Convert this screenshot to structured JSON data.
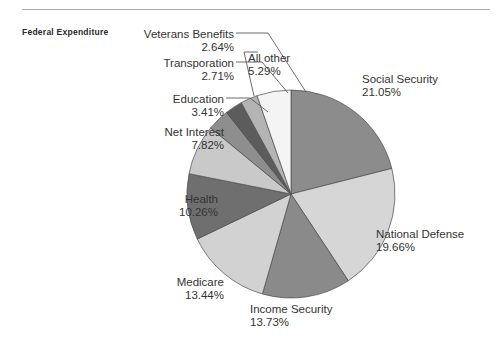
{
  "series_title": "Federal Expenditure",
  "chart_data": {
    "type": "pie",
    "title": "Federal Expenditure",
    "xlabel": "",
    "ylabel": "",
    "units": "percent",
    "legend_position": "none",
    "grid": false,
    "start_angle_deg": 0,
    "direction": "clockwise",
    "categories": [
      "Social Security",
      "National Defense",
      "Income Security",
      "Medicare",
      "Health",
      "Net Interest",
      "Education",
      "Transporation",
      "Veterans Benefits",
      "All other"
    ],
    "values": [
      21.05,
      19.66,
      13.73,
      13.44,
      10.26,
      7.82,
      3.41,
      2.71,
      2.64,
      5.29
    ],
    "value_labels": [
      "21.05%",
      "19.66%",
      "13.73%",
      "13.44%",
      "10.26%",
      "7.82%",
      "3.41%",
      "2.71%",
      "2.64%",
      "5.29%"
    ],
    "colors": [
      "#8c8c8c",
      "#d6d6d6",
      "#8a8a8a",
      "#d2d2d2",
      "#6f6f6f",
      "#c9c9c9",
      "#8e8e8e",
      "#5c5c5c",
      "#b4b4b4",
      "#f4f4f4"
    ],
    "slices": [
      {
        "label": "Social Security",
        "value": 21.05,
        "value_label": "21.05%",
        "color": "#8c8c8c"
      },
      {
        "label": "National Defense",
        "value": 19.66,
        "value_label": "19.66%",
        "color": "#d6d6d6"
      },
      {
        "label": "Income Security",
        "value": 13.73,
        "value_label": "13.73%",
        "color": "#8a8a8a"
      },
      {
        "label": "Medicare",
        "value": 13.44,
        "value_label": "13.44%",
        "color": "#d2d2d2"
      },
      {
        "label": "Health",
        "value": 10.26,
        "value_label": "10.26%",
        "color": "#6f6f6f"
      },
      {
        "label": "Net Interest",
        "value": 7.82,
        "value_label": "7.82%",
        "color": "#c9c9c9"
      },
      {
        "label": "Education",
        "value": 3.41,
        "value_label": "3.41%",
        "color": "#8e8e8e"
      },
      {
        "label": "Transporation",
        "value": 2.71,
        "value_label": "2.71%",
        "color": "#5c5c5c"
      },
      {
        "label": "Veterans Benefits",
        "value": 2.64,
        "value_label": "2.64%",
        "color": "#b4b4b4"
      },
      {
        "label": "All other",
        "value": 5.29,
        "value_label": "5.29%",
        "color": "#f4f4f4"
      }
    ]
  },
  "labels": {
    "veterans": {
      "name": "Veterans Benefits",
      "pct": "2.64%"
    },
    "transport": {
      "name": "Transporation",
      "pct": "2.71%"
    },
    "education": {
      "name": "Education",
      "pct": "3.41%"
    },
    "netint": {
      "name": "Net Interest",
      "pct": "7.82%"
    },
    "health": {
      "name": "Health",
      "pct": "10.26%"
    },
    "medicare": {
      "name": "Medicare",
      "pct": "13.44%"
    },
    "income": {
      "name": "Income Security",
      "pct": "13.73%"
    },
    "defense": {
      "name": "National Defense",
      "pct": "19.66%"
    },
    "social": {
      "name": "Social Security",
      "pct": "21.05%"
    },
    "allother": {
      "name": "All other",
      "pct": "5.29%"
    }
  }
}
